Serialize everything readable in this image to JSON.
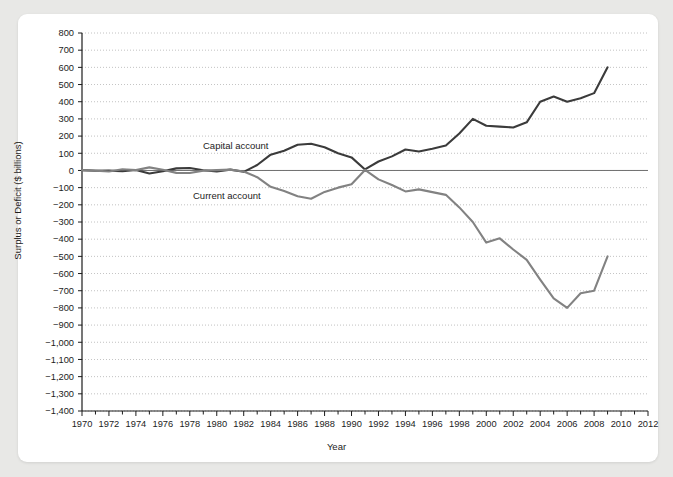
{
  "top_caption": "",
  "chart_data": {
    "type": "line",
    "title": "",
    "xlabel": "Year",
    "ylabel": "Surplus or Deficit ($ billions)",
    "xlim": [
      1970,
      2012
    ],
    "ylim": [
      -1400,
      800
    ],
    "ytick_step": 100,
    "xtick_step": 1,
    "xticklabel_step": 2,
    "grid": true,
    "legend_position": "inline-annotation",
    "xticklabels": [
      "1970",
      "1972",
      "1974",
      "1976",
      "1978",
      "1980",
      "1982",
      "1984",
      "1986",
      "1988",
      "1990",
      "1992",
      "1994",
      "1996",
      "1998",
      "2000",
      "2002",
      "2004",
      "2006",
      "2008",
      "2010",
      "2012"
    ],
    "yticklabels": [
      "800",
      "700",
      "600",
      "500",
      "400",
      "300",
      "200",
      "100",
      "0",
      "-100",
      "-200",
      "-300",
      "-400",
      "-500",
      "-600",
      "-700",
      "-800",
      "-900",
      "-1,000",
      "-1,100",
      "-1,200",
      "-1,300",
      "-1,400"
    ],
    "colors": {
      "capital_account": "#3b3b3b",
      "current_account": "#828282",
      "grid": "#9a9a9a",
      "axis": "#1c1c1c"
    },
    "x": [
      1970,
      1971,
      1972,
      1973,
      1974,
      1975,
      1976,
      1977,
      1978,
      1979,
      1980,
      1981,
      1982,
      1983,
      1984,
      1985,
      1986,
      1987,
      1988,
      1989,
      1990,
      1991,
      1992,
      1993,
      1994,
      1995,
      1996,
      1997,
      1998,
      1999,
      2000,
      2001,
      2002,
      2003,
      2004,
      2005,
      2006,
      2007,
      2008,
      2009
    ],
    "series": [
      {
        "name": "Capital account",
        "color": "#3b3b3b",
        "values": [
          2,
          -2,
          -1,
          -5,
          3,
          -18,
          -5,
          12,
          14,
          1,
          -6,
          5,
          -8,
          32,
          92,
          115,
          150,
          155,
          135,
          100,
          76,
          6,
          52,
          82,
          122,
          110,
          126,
          145,
          215,
          300,
          260,
          255,
          250,
          280,
          400,
          430,
          400,
          420,
          450,
          600
        ]
      },
      {
        "name": "Current account",
        "color": "#828282",
        "values": [
          2,
          -1,
          -6,
          7,
          2,
          18,
          4,
          -14,
          -15,
          -1,
          2,
          5,
          -6,
          -39,
          -95,
          -120,
          -150,
          -165,
          -125,
          -100,
          -80,
          3,
          -52,
          -85,
          -122,
          -110,
          -126,
          -142,
          -215,
          -300,
          -420,
          -395,
          -460,
          -520,
          -635,
          -745,
          -800,
          -715,
          -700,
          -500
        ]
      }
    ]
  }
}
